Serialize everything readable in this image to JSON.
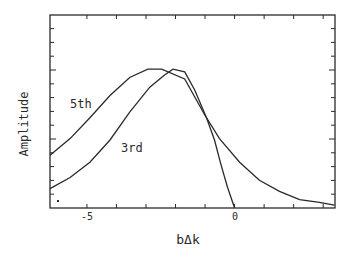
{
  "chart_data": {
    "type": "line",
    "title": "",
    "xlabel": "bΔk",
    "ylabel": "Amplitude",
    "xlim": [
      -6.25,
      3.4
    ],
    "ylim": [
      0,
      1.39
    ],
    "x_ticks": [
      -5,
      -4,
      -3,
      -2,
      -1,
      0,
      1,
      2,
      3
    ],
    "x_tick_labels": [
      {
        "value": -5,
        "label": "-5"
      },
      {
        "value": 0,
        "label": "0"
      }
    ],
    "y_tick_labels": [],
    "grid": false,
    "legend": "none (inline curve labels)",
    "series": [
      {
        "name": "5th",
        "label_position": {
          "x": -5.6,
          "y": 0.77
        },
        "x": [
          -6.25,
          -5.57,
          -4.9,
          -4.22,
          -3.55,
          -2.94,
          -2.47,
          -1.69,
          -1.01,
          -0.51,
          0.17,
          0.84,
          1.52,
          2.2,
          2.87,
          3.38
        ],
        "y": [
          0.38,
          0.5,
          0.65,
          0.81,
          0.94,
          1.0,
          1.0,
          0.93,
          0.67,
          0.5,
          0.33,
          0.2,
          0.12,
          0.06,
          0.04,
          0.02
        ]
      },
      {
        "name": "3rd",
        "label_position": {
          "x": -3.0,
          "y": 0.45
        },
        "x": [
          -6.25,
          -5.57,
          -4.9,
          -4.22,
          -3.55,
          -2.87,
          -2.36,
          -2.09,
          -1.69,
          -1.35,
          -0.95,
          -0.68,
          -0.47,
          -0.24,
          0.0
        ],
        "y": [
          0.14,
          0.22,
          0.33,
          0.49,
          0.69,
          0.87,
          0.96,
          1.0,
          0.98,
          0.85,
          0.65,
          0.49,
          0.32,
          0.15,
          0.0
        ]
      }
    ]
  },
  "labels": {
    "xlabel": "bΔk",
    "ylabel": "Amplitude",
    "series_5th": "5th",
    "series_3rd": "3rd",
    "tick_neg5": "-5",
    "tick_0": "0"
  }
}
